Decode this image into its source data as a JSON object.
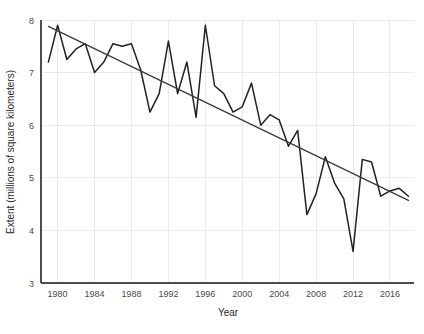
{
  "chart_data": {
    "type": "line",
    "title": "",
    "xlabel": "Year",
    "ylabel": "Extent (millions of square kilometers)",
    "xlim": [
      1978.2,
      2018.6
    ],
    "ylim": [
      3,
      8
    ],
    "xticks": [
      1980,
      1984,
      1988,
      1992,
      1996,
      2000,
      2004,
      2008,
      2012,
      2016
    ],
    "xtick_labels": [
      "1980",
      "1984",
      "1988",
      "1992",
      "1996",
      "2000",
      "2004",
      "2008",
      "2012",
      "2016"
    ],
    "yticks": [
      3,
      4,
      5,
      6,
      7,
      8
    ],
    "ytick_labels": [
      "3",
      "4",
      "5",
      "6",
      "7",
      "8"
    ],
    "grid": true,
    "legend": "none",
    "series": [
      {
        "name": "Arctic sea ice extent",
        "color": "#222222",
        "x": [
          1979,
          1980,
          1981,
          1982,
          1983,
          1984,
          1985,
          1986,
          1987,
          1988,
          1989,
          1990,
          1991,
          1992,
          1993,
          1994,
          1995,
          1996,
          1997,
          1998,
          1999,
          2000,
          2001,
          2002,
          2003,
          2004,
          2005,
          2006,
          2007,
          2008,
          2009,
          2010,
          2011,
          2012,
          2013,
          2014,
          2015,
          2016,
          2017,
          2018
        ],
        "values": [
          7.2,
          7.9,
          7.25,
          7.45,
          7.55,
          7.0,
          7.2,
          7.55,
          7.5,
          7.55,
          7.05,
          6.25,
          6.6,
          7.6,
          6.6,
          7.2,
          6.15,
          7.9,
          6.75,
          6.6,
          6.25,
          6.35,
          6.8,
          6.0,
          6.2,
          6.1,
          5.6,
          5.9,
          4.3,
          4.7,
          5.4,
          4.9,
          4.6,
          3.6,
          5.35,
          5.3,
          4.65,
          4.75,
          4.8,
          4.65
        ]
      }
    ],
    "trend": {
      "name": "linear trend line",
      "color": "#3a3a3a",
      "x": [
        1979,
        2018
      ],
      "values": [
        7.88,
        4.57
      ]
    }
  },
  "axes": {
    "x_title": "Year",
    "y_title": "Extent (millions of square kilometers)"
  }
}
